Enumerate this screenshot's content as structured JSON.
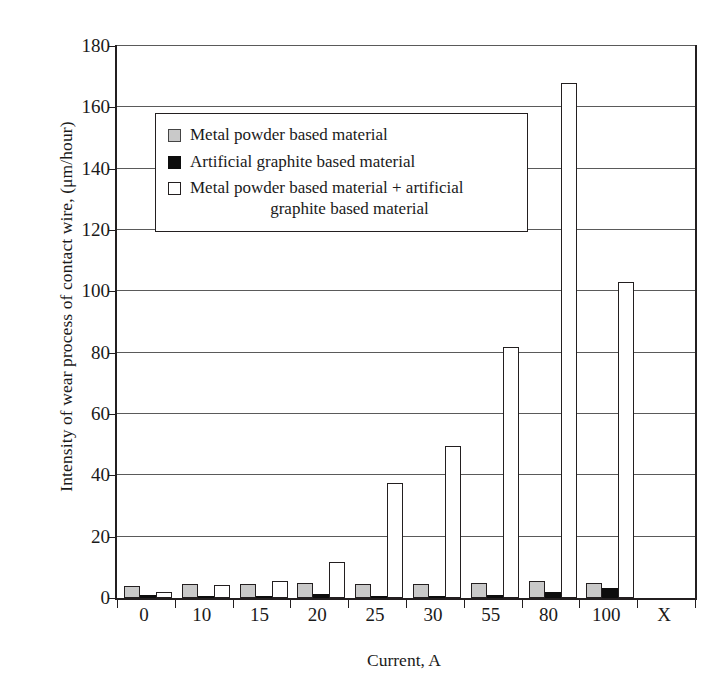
{
  "chart_data": {
    "type": "bar",
    "title": "",
    "xlabel": "Current, A",
    "ylabel": "Intensity of wear process of contact wire, (μm/hour)",
    "categories": [
      "0",
      "10",
      "15",
      "20",
      "25",
      "30",
      "55",
      "80",
      "100",
      "X"
    ],
    "ylim": [
      0,
      180
    ],
    "yticks": [
      0,
      20,
      40,
      60,
      80,
      100,
      120,
      140,
      160,
      180
    ],
    "ytick_labels": [
      "0",
      "20",
      "40",
      "60",
      "80",
      "100",
      "120",
      "140",
      "160",
      "180"
    ],
    "grid": true,
    "legend_position": "upper-left-inside",
    "series": [
      {
        "name": "Metal powder based material",
        "swatch": "gray-square",
        "color": "#c9c9c9",
        "values": [
          4.0,
          4.6,
          4.5,
          5.0,
          4.6,
          4.7,
          5.0,
          5.7,
          4.8,
          null
        ]
      },
      {
        "name": "Artificial graphite based material",
        "swatch": "black-square",
        "color": "#0d0d0d",
        "values": [
          1.0,
          0.4,
          0.5,
          1.3,
          0.4,
          0.6,
          1.0,
          1.8,
          3.4,
          null
        ]
      },
      {
        "name": "Metal powder based material + artificial graphite based material",
        "swatch": "white-square",
        "color": "#ffffff",
        "values": [
          2.0,
          4.4,
          5.6,
          11.7,
          37.4,
          49.6,
          82.0,
          167.8,
          103.0,
          null
        ]
      }
    ]
  },
  "legend": {
    "items": [
      {
        "label": "Metal powder based material",
        "label_line2": ""
      },
      {
        "label": "Artificial graphite based material",
        "label_line2": ""
      },
      {
        "label": "Metal powder based material + artificial",
        "label_line2": "graphite based material"
      }
    ]
  },
  "axes": {
    "y_title": "Intensity of wear process of contact wire, (μm/hour)",
    "x_title": "Current, A"
  }
}
